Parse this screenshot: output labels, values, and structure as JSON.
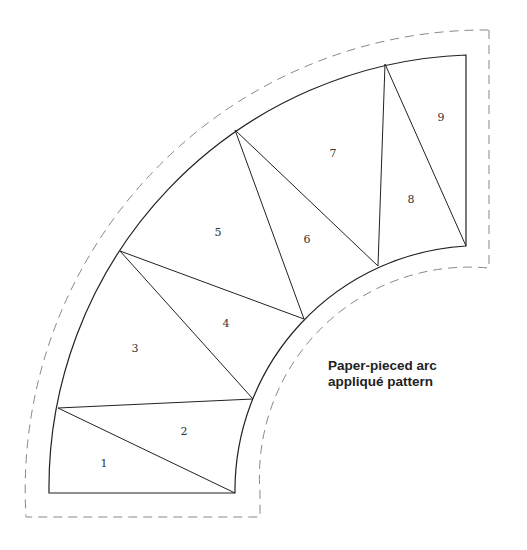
{
  "caption": {
    "line1": "Paper-pieced arc",
    "line2": "appliqué pattern"
  },
  "pieces": [
    {
      "label": "1",
      "x": 104,
      "y": 467
    },
    {
      "label": "2",
      "x": 184,
      "y": 435
    },
    {
      "label": "3",
      "x": 135,
      "y": 352
    },
    {
      "label": "4",
      "x": 226,
      "y": 327
    },
    {
      "label": "5",
      "x": 218,
      "y": 236
    },
    {
      "label": "6",
      "x": 307,
      "y": 243
    },
    {
      "label": "7",
      "x": 333,
      "y": 157
    },
    {
      "label": "8",
      "x": 411,
      "y": 203
    },
    {
      "label": "9",
      "x": 441,
      "y": 121
    }
  ],
  "colors": {
    "line": "#222222",
    "dashed": "#888888"
  }
}
